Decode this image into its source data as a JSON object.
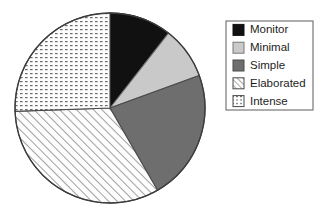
{
  "chart_data": {
    "type": "pie",
    "title": "",
    "subtitle": "",
    "xlabel": "",
    "ylabel": "",
    "grid": false,
    "legend_position": "right",
    "start_angle_deg": 0,
    "direction": "clockwise",
    "center": {
      "x": 110,
      "y": 108
    },
    "radius": 95,
    "categories": [
      "Monitor",
      "Minimal",
      "Simple",
      "Elaborated",
      "Intense"
    ],
    "values": [
      10.5,
      9.0,
      22.0,
      33.0,
      25.5
    ],
    "angles_deg": [
      38,
      32,
      80,
      118,
      92
    ],
    "boundaries_deg": [
      0,
      38,
      70,
      150,
      268,
      360
    ],
    "slices": [
      {
        "label": "Monitor",
        "value": 10.5,
        "angle_deg": 38,
        "start_deg": 0,
        "end_deg": 38,
        "fill": "#111111",
        "pattern": "solid",
        "stroke": "#111111"
      },
      {
        "label": "Minimal",
        "value": 9.0,
        "angle_deg": 32,
        "start_deg": 38,
        "end_deg": 70,
        "fill": "#c9c9c9",
        "pattern": "solid",
        "stroke": "#6f6f6f"
      },
      {
        "label": "Simple",
        "value": 22.0,
        "angle_deg": 80,
        "start_deg": 70,
        "end_deg": 150,
        "fill": "#6e6e6e",
        "pattern": "solid",
        "stroke": "#4a4a4a"
      },
      {
        "label": "Elaborated",
        "value": 33.0,
        "angle_deg": 118,
        "start_deg": 150,
        "end_deg": 268,
        "fill": "#fdfdfd",
        "pattern": "diagonal-hatch",
        "stroke": "#4a4a4a"
      },
      {
        "label": "Intense",
        "value": 25.5,
        "angle_deg": 92,
        "start_deg": 268,
        "end_deg": 360,
        "fill": "#fdfdfd",
        "pattern": "dotted-stipple",
        "stroke": "#4a4a4a"
      }
    ],
    "annotations": []
  },
  "legend": {
    "box": {
      "x": 226,
      "y": 21,
      "width": 87,
      "height": 89
    },
    "border_color": "#6a6a6a",
    "background": "#ffffff",
    "entries": [
      {
        "label": "Monitor",
        "swatch": "monitor-swatch",
        "pattern": "solid",
        "fill": "#111111",
        "stroke": "#111111"
      },
      {
        "label": "Minimal",
        "swatch": "minimal-swatch",
        "pattern": "solid",
        "fill": "#cacaca",
        "stroke": "#787878"
      },
      {
        "label": "Simple",
        "swatch": "simple-swatch",
        "pattern": "solid",
        "fill": "#6e6e6e",
        "stroke": "#4a4a4a"
      },
      {
        "label": "Elaborated",
        "swatch": "elaborated-swatch",
        "pattern": "diagonal-hatch",
        "fill": "#fdfdfd",
        "stroke": "#4a4a4a"
      },
      {
        "label": "Intense",
        "swatch": "intense-swatch",
        "pattern": "dotted-stipple",
        "fill": "#fdfdfd",
        "stroke": "#4a4a4a"
      }
    ]
  },
  "colors": {
    "background": "#ffffff",
    "text": "#1d1d1d",
    "outline": "#3c3c3c",
    "legend_border": "#6a6a6a"
  }
}
